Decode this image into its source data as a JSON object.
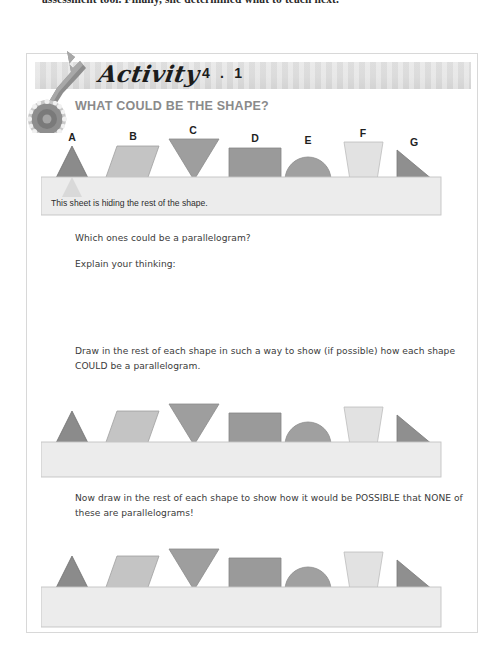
{
  "page": {
    "running_text": "assessment tool. Finally, she determined what to teach next."
  },
  "activity": {
    "word": "Activity",
    "number": "4 . 1",
    "title": "WHAT COULD BE THE SHAPE?",
    "icon_wrench": "wrench-icon",
    "icon_gear": "gear-icon"
  },
  "scene1": {
    "sheet_text": "This sheet is hiding the rest of the shape.",
    "labels": [
      "A",
      "B",
      "C",
      "D",
      "E",
      "F",
      "G"
    ]
  },
  "questions": {
    "q1": "Which ones could be a parallelogram?",
    "q2": "Explain your thinking:",
    "instruction1": "Draw in the rest of each shape in such a way to show (if possible) how each shape COULD be a parallelogram.",
    "instruction2": "Now draw in the rest of each shape to show how it would be POSSIBLE that NONE of these are parallelograms!"
  },
  "colors": {
    "shape_dark": "#7e7e7e",
    "shape_mid": "#9a9a9a",
    "shape_light": "#c9c9c9",
    "shape_pale": "#dcdcdc",
    "sheet_fill": "#ececec",
    "sheet_border": "#c4c4c4",
    "header_band": "#dedede",
    "title_gray": "#8a8a8a",
    "body_gray": "#3a3a3a"
  }
}
